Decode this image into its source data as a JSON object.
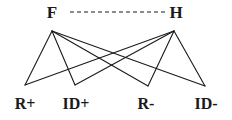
{
  "diagram": {
    "type": "bipartite-graph",
    "width": 232,
    "height": 120,
    "background_color": "#ffffff",
    "line_color": "#1a1a1a",
    "label_color": "#1a1a1a",
    "top_nodes": [
      {
        "id": "F",
        "label": "F",
        "x": 52,
        "y": 12,
        "vertex_x": 52,
        "vertex_y": 31
      },
      {
        "id": "H",
        "label": "H",
        "x": 176,
        "y": 12,
        "vertex_x": 174,
        "vertex_y": 31
      }
    ],
    "bottom_nodes": [
      {
        "id": "R+",
        "label": "R+",
        "x": 25,
        "y": 104,
        "vertex_x": 25,
        "vertex_y": 85
      },
      {
        "id": "ID+",
        "label": "ID+",
        "x": 76,
        "y": 104,
        "vertex_x": 75,
        "vertex_y": 85
      },
      {
        "id": "R-",
        "label": "R-",
        "x": 146,
        "y": 104,
        "vertex_x": 148,
        "vertex_y": 86
      },
      {
        "id": "ID-",
        "label": "ID-",
        "x": 206,
        "y": 104,
        "vertex_x": 205,
        "vertex_y": 86
      }
    ],
    "solid_edges": [
      {
        "from": "F",
        "to": "R+"
      },
      {
        "from": "F",
        "to": "ID+"
      },
      {
        "from": "F",
        "to": "R-"
      },
      {
        "from": "F",
        "to": "ID-"
      },
      {
        "from": "H",
        "to": "R+"
      },
      {
        "from": "H",
        "to": "ID+"
      },
      {
        "from": "H",
        "to": "R-"
      },
      {
        "from": "H",
        "to": "ID-"
      }
    ],
    "dashed_edges": [
      {
        "from": "F",
        "to": "H",
        "y": 12,
        "x1": 70,
        "x2": 166
      }
    ]
  }
}
